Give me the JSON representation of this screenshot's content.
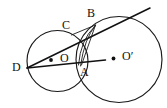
{
  "figure": {
    "canvas": {
      "width": 167,
      "height": 108,
      "background": "#ffffff"
    },
    "stroke_color": "#111111",
    "circle_stroke_color": "#1a1a1a",
    "circles": [
      {
        "name": "left-circle",
        "center_label": "O",
        "cx": 57.5,
        "cy": 61.0,
        "r": 30.5
      },
      {
        "name": "right-circle",
        "center_label": "O′",
        "cx": 119.0,
        "cy": 59.5,
        "r": 43.0
      }
    ],
    "points": [
      {
        "id": "D",
        "label": "D",
        "x": 27.0,
        "y": 68.0,
        "label_x": 12,
        "label_y": 61
      },
      {
        "id": "A",
        "label": "A",
        "x": 82.0,
        "y": 63.5,
        "label_x": 80,
        "label_y": 66
      },
      {
        "id": "B",
        "label": "B",
        "x": 95.5,
        "y": 25.0,
        "label_x": 87,
        "label_y": 7
      },
      {
        "id": "C",
        "label": "C",
        "x": 71.5,
        "y": 34.5,
        "label_x": 62,
        "label_y": 19
      },
      {
        "id": "O",
        "label": "O",
        "x": 57.5,
        "y": 61.0,
        "label_x": 60,
        "label_y": 52
      },
      {
        "id": "Oprime",
        "label": "O′",
        "x": 119.0,
        "y": 59.5,
        "label_x": 122,
        "label_y": 50
      }
    ],
    "segments": [
      {
        "name": "secant-D-to-B-extended",
        "x1": 27.0,
        "y1": 68.0,
        "x2": 150.0,
        "y2": 8.0
      },
      {
        "name": "secant-D-to-A-extended",
        "x1": 27.0,
        "y1": 68.0,
        "x2": 105.5,
        "y2": 60.0
      },
      {
        "name": "chord-B-to-A",
        "x1": 95.5,
        "y1": 25.0,
        "x2": 81.5,
        "y2": 65.0
      },
      {
        "name": "chord-B-to-C",
        "x1": 95.5,
        "y1": 25.0,
        "x2": 71.5,
        "y2": 35.0
      }
    ],
    "arcs": [
      {
        "name": "arc-B-to-A-outer",
        "d": "M 95.5 25.5 Q 84.5 38 80.5 66"
      },
      {
        "name": "arc-B-to-A-inner",
        "d": "M 94.5 26.5 Q 80.5 40 78.5 65"
      }
    ],
    "center_dots": [
      {
        "name": "dot-O",
        "cx": 51.0,
        "cy": 60.0,
        "r": 1.9
      },
      {
        "name": "dot-O-prime",
        "cx": 113.5,
        "cy": 58.5,
        "r": 1.9
      }
    ]
  }
}
